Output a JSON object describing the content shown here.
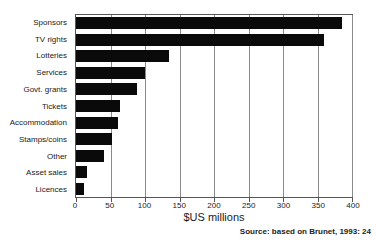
{
  "chart_data": {
    "type": "bar",
    "orientation": "horizontal",
    "title": "",
    "xlabel": "$US millions",
    "ylabel": "",
    "xlim": [
      0,
      400
    ],
    "xticks": [
      0,
      50,
      100,
      150,
      200,
      250,
      300,
      350,
      400
    ],
    "grid": "vertical",
    "legend": "none",
    "categories": [
      "Sponsors",
      "TV rights",
      "Lotteries",
      "Services",
      "Govt. grants",
      "Tickets",
      "Accommodation",
      "Stamps/coins",
      "Other",
      "Asset sales",
      "Licences"
    ],
    "values": [
      385,
      360,
      135,
      100,
      88,
      64,
      61,
      52,
      40,
      16,
      12
    ]
  },
  "source_note": "Source: based on Brunet, 1993: 24",
  "colors": {
    "bar": "#0a0a0a",
    "gridline": "#8a8a8a",
    "plot_border": "#555555",
    "background": "#ffffff",
    "text": "#1a1a1a"
  }
}
